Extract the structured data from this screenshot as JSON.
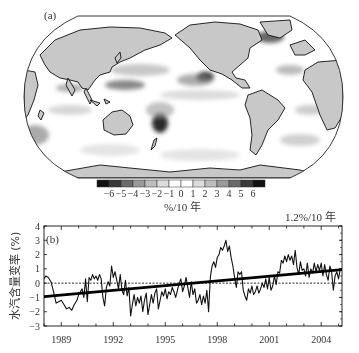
{
  "panel_a": {
    "label": "(a)",
    "colorbar": {
      "ticks": [
        "-6",
        "-5",
        "-4",
        "-3",
        "-2",
        "-1",
        "0",
        "1",
        "2",
        "3",
        "4",
        "5",
        "6"
      ],
      "colors": [
        "#111111",
        "#3a3a3a",
        "#6a6a6a",
        "#9a9a9a",
        "#bdbdbd",
        "#dcdcdc",
        "#ffffff",
        "#ffffff",
        "#dcdcdc",
        "#bdbdbd",
        "#9a9a9a",
        "#6a6a6a",
        "#3a3a3a",
        "#111111"
      ],
      "unit": "%/10 年"
    },
    "land_color": "#c8c8c8",
    "ocean_color": "#ffffff"
  },
  "panel_b": {
    "label": "(b)",
    "trend_label": "1.2%/10 年",
    "ylabel": "水汽含量变率 (%)"
  },
  "chart_data": [
    {
      "type": "heatmap",
      "title": "(a)",
      "description": "Global map of water vapor content trend",
      "colorbar_label": "%/10 年",
      "colorbar_ticks": [
        -6,
        -5,
        -4,
        -3,
        -2,
        -1,
        0,
        1,
        2,
        3,
        4,
        5,
        6
      ],
      "vmin": -7,
      "vmax": 7
    },
    {
      "type": "line",
      "title": "(b)",
      "xlabel": "",
      "ylabel": "水汽含量变率 (%)",
      "xlim": [
        1988.0,
        2005.2
      ],
      "ylim": [
        -3,
        4
      ],
      "yticks": [
        -3,
        -2,
        -1,
        0,
        1,
        2,
        3,
        4
      ],
      "xticks": [
        1989,
        1992,
        1995,
        1998,
        2001,
        2004
      ],
      "annotation": "1.2%/10 年",
      "grid": false,
      "series": [
        {
          "name": "anomaly",
          "x": [
            1988.0,
            1988.1,
            1988.25,
            1988.4,
            1988.55,
            1988.7,
            1988.85,
            1989.0,
            1989.15,
            1989.3,
            1989.45,
            1989.6,
            1989.75,
            1989.9,
            1990.0,
            1990.1,
            1990.2,
            1990.3,
            1990.4,
            1990.5,
            1990.6,
            1990.7,
            1990.8,
            1990.9,
            1991.0,
            1991.1,
            1991.2,
            1991.3,
            1991.4,
            1991.5,
            1991.6,
            1991.7,
            1991.8,
            1991.9,
            1992.0,
            1992.1,
            1992.2,
            1992.3,
            1992.4,
            1992.5,
            1992.6,
            1992.7,
            1992.8,
            1992.9,
            1993.0,
            1993.1,
            1993.2,
            1993.3,
            1993.4,
            1993.5,
            1993.6,
            1993.7,
            1993.8,
            1993.9,
            1994.0,
            1994.1,
            1994.2,
            1994.3,
            1994.4,
            1994.5,
            1994.6,
            1994.7,
            1994.8,
            1994.9,
            1995.0,
            1995.1,
            1995.2,
            1995.3,
            1995.4,
            1995.5,
            1995.6,
            1995.7,
            1995.8,
            1995.9,
            1996.0,
            1996.1,
            1996.2,
            1996.3,
            1996.4,
            1996.5,
            1996.6,
            1996.7,
            1996.8,
            1996.9,
            1997.0,
            1997.1,
            1997.2,
            1997.3,
            1997.4,
            1997.5,
            1997.6,
            1997.7,
            1997.8,
            1997.9,
            1998.0,
            1998.1,
            1998.2,
            1998.3,
            1998.4,
            1998.5,
            1998.6,
            1998.7,
            1998.8,
            1998.9,
            1999.0,
            1999.1,
            1999.2,
            1999.3,
            1999.4,
            1999.5,
            1999.6,
            1999.7,
            1999.8,
            1999.9,
            2000.0,
            2000.1,
            2000.2,
            2000.3,
            2000.4,
            2000.5,
            2000.6,
            2000.7,
            2000.8,
            2000.9,
            2001.0,
            2001.1,
            2001.2,
            2001.3,
            2001.4,
            2001.5,
            2001.6,
            2001.7,
            2001.8,
            2001.9,
            2002.0,
            2002.1,
            2002.2,
            2002.3,
            2002.4,
            2002.5,
            2002.6,
            2002.7,
            2002.8,
            2002.9,
            2003.0,
            2003.1,
            2003.2,
            2003.3,
            2003.4,
            2003.5,
            2003.6,
            2003.7,
            2003.8,
            2003.9,
            2004.0,
            2004.1,
            2004.2,
            2004.3,
            2004.4,
            2004.5,
            2004.6,
            2004.7,
            2004.8,
            2004.9,
            2005.0,
            2005.1
          ],
          "y": [
            0.3,
            0.5,
            0.4,
            0.1,
            -0.6,
            -1.4,
            -1.3,
            -1.2,
            -1.5,
            -1.8,
            -1.7,
            -1.9,
            -1.5,
            -1.2,
            -0.8,
            -0.6,
            -0.4,
            -1.0,
            0.3,
            -1.3,
            0.4,
            0.2,
            0.6,
            0.3,
            0.5,
            0.2,
            0.6,
            0.3,
            -1.0,
            -1.6,
            -0.3,
            0.1,
            -0.2,
            1.2,
            0.4,
            0.8,
            0.2,
            -0.4,
            0.6,
            -0.5,
            -0.8,
            0.2,
            -0.9,
            -0.3,
            -2.3,
            -1.5,
            -0.8,
            -1.6,
            -1.0,
            -1.4,
            -0.9,
            -2.0,
            -1.2,
            -0.7,
            -2.2,
            -1.5,
            -0.8,
            -1.4,
            -0.7,
            -0.4,
            -1.8,
            -1.2,
            -0.6,
            -0.9,
            -0.4,
            -1.1,
            -0.6,
            -0.8,
            -0.3,
            -0.6,
            -1.0,
            -0.5,
            0.0,
            0.3,
            -0.6,
            -0.2,
            0.4,
            -0.3,
            -1.0,
            0.1,
            -0.8,
            -0.4,
            -1.4,
            -1.2,
            -0.8,
            -1.5,
            -0.9,
            -1.4,
            -0.5,
            -2.0,
            0.4,
            1.2,
            1.5,
            1.1,
            1.8,
            2.0,
            2.5,
            2.3,
            2.6,
            3.0,
            2.2,
            2.6,
            1.8,
            1.2,
            0.4,
            -0.3,
            0.8,
            0.6,
            0.8,
            -0.5,
            -0.9,
            -1.2,
            -0.4,
            -0.7,
            -0.2,
            -0.8,
            -0.6,
            -0.2,
            -0.7,
            -0.4,
            0.0,
            -0.3,
            0.3,
            -0.4,
            0.4,
            -0.5,
            -0.2,
            0.5,
            -0.1,
            0.8,
            0.7,
            1.6,
            1.4,
            1.9,
            1.5,
            2.0,
            1.6,
            1.9,
            1.3,
            2.3,
            1.1,
            0.6,
            1.5,
            0.9,
            1.0,
            0.5,
            1.4,
            0.4,
            1.0,
            0.7,
            1.4,
            0.8,
            1.3,
            0.9,
            1.4,
            0.5,
            1.3,
            0.6,
            0.2,
            1.2,
            0.8,
            -0.5,
            0.5,
            0.8,
            0.3,
            1.0
          ]
        },
        {
          "name": "trend",
          "x": [
            1988.0,
            2005.2
          ],
          "y": [
            -0.95,
            0.95
          ]
        },
        {
          "name": "zero",
          "x": [
            1988.0,
            2005.2
          ],
          "y": [
            0,
            0
          ],
          "style": "dashed"
        }
      ]
    }
  ]
}
